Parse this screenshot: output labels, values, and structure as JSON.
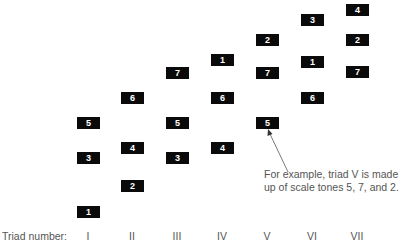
{
  "diagram": {
    "axis_label": "Triad number:",
    "triads": [
      {
        "numeral": "I",
        "tones": [
          "5",
          "3",
          "1"
        ]
      },
      {
        "numeral": "II",
        "tones": [
          "6",
          "4",
          "2"
        ]
      },
      {
        "numeral": "III",
        "tones": [
          "7",
          "5",
          "3"
        ]
      },
      {
        "numeral": "IV",
        "tones": [
          "1",
          "6",
          "4"
        ]
      },
      {
        "numeral": "V",
        "tones": [
          "2",
          "7",
          "5"
        ]
      },
      {
        "numeral": "VI",
        "tones": [
          "3",
          "1",
          "6"
        ]
      },
      {
        "numeral": "VII",
        "tones": [
          "4",
          "2",
          "7"
        ]
      }
    ],
    "annotation": {
      "line1": "For example, triad V is made",
      "line2": "up of scale tones 5, 7, and 2."
    },
    "colors": {
      "box": "#0a0a0a",
      "box_text": "#ffffff",
      "label": "#555555"
    }
  }
}
